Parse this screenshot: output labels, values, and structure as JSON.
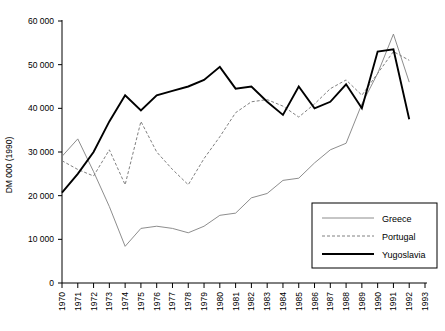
{
  "chart_data": {
    "type": "line",
    "title": "",
    "xlabel": "",
    "ylabel": "DM 000 (1990)",
    "ylim": [
      0,
      60000
    ],
    "xlim": [
      1970,
      1993
    ],
    "grid": false,
    "legend_position": "bottom-right",
    "ytick_labels": [
      "0",
      "10 000",
      "20 000",
      "30 000",
      "40 000",
      "50 000",
      "60 000"
    ],
    "ytick_values": [
      0,
      10000,
      20000,
      30000,
      40000,
      50000,
      60000
    ],
    "x": [
      1970,
      1971,
      1972,
      1973,
      1974,
      1975,
      1976,
      1977,
      1978,
      1979,
      1980,
      1981,
      1982,
      1983,
      1984,
      1985,
      1986,
      1987,
      1988,
      1989,
      1990,
      1991,
      1992
    ],
    "xtick_labels": [
      "1970",
      "1971",
      "1972",
      "1973",
      "1974",
      "1975",
      "1976",
      "1977",
      "1978",
      "1979",
      "1980",
      "1981",
      "1982",
      "1983",
      "1984",
      "1985",
      "1986",
      "1987",
      "1988",
      "1989",
      "1990",
      "1991",
      "1992",
      "1993"
    ],
    "series": [
      {
        "name": "Greece",
        "style": "solid-thin",
        "color": "#808080",
        "values": [
          29000,
          33000,
          25500,
          17500,
          8400,
          12500,
          13000,
          12500,
          11500,
          13000,
          15500,
          16000,
          19500,
          20500,
          23500,
          24000,
          27500,
          30500,
          32000,
          41000,
          48000,
          57000,
          46000
        ]
      },
      {
        "name": "Portugal",
        "style": "dashed",
        "color": "#808080",
        "values": [
          28000,
          26000,
          24500,
          30500,
          22500,
          37000,
          30000,
          26000,
          22500,
          28500,
          33500,
          39000,
          41500,
          42000,
          40500,
          38000,
          41000,
          44500,
          46500,
          43000,
          48000,
          53000,
          51000
        ]
      },
      {
        "name": "Yugoslavia",
        "style": "solid-thick",
        "color": "#000000",
        "values": [
          20700,
          25000,
          30000,
          37000,
          43000,
          39500,
          43000,
          44000,
          45000,
          46500,
          49500,
          44500,
          45000,
          41500,
          38500,
          45000,
          40000,
          41500,
          45500,
          40000,
          53000,
          53500,
          37500
        ]
      }
    ]
  },
  "legend": {
    "items": [
      {
        "label": "Greece"
      },
      {
        "label": "Portugal"
      },
      {
        "label": "Yugoslavia"
      }
    ]
  }
}
